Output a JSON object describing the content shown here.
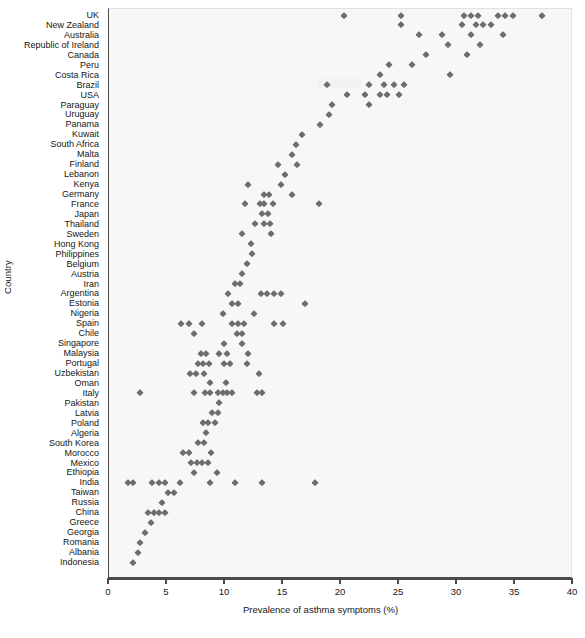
{
  "chart_data": {
    "type": "scatter",
    "title": "",
    "xlabel": "Prevalence of asthma symptoms (%)",
    "ylabel": "Country",
    "xlim": [
      0,
      40
    ],
    "xticks": [
      0,
      5,
      10,
      15,
      20,
      25,
      30,
      35,
      40
    ],
    "grid": false,
    "legend": "none",
    "marker": "diamond",
    "marker_color": "#6d6d6d",
    "panel_color": "#f7f7f7",
    "categories": [
      "UK",
      "New Zealand",
      "Australia",
      "Republic of Ireland",
      "Canada",
      "Peru",
      "Costa Rica",
      "Brazil",
      "USA",
      "Paraguay",
      "Uruguay",
      "Panama",
      "Kuwait",
      "South Africa",
      "Malta",
      "Finland",
      "Lebanon",
      "Kenya",
      "Germany",
      "France",
      "Japan",
      "Thailand",
      "Sweden",
      "Hong Kong",
      "Philippines",
      "Belgium",
      "Austria",
      "Iran",
      "Argentina",
      "Estonia",
      "Nigeria",
      "Spain",
      "Chile",
      "Singapore",
      "Malaysia",
      "Portugal",
      "Uzbekistan",
      "Oman",
      "Italy",
      "Pakistan",
      "Latvia",
      "Poland",
      "Algeria",
      "South Korea",
      "Morocco",
      "Mexico",
      "Ethiopia",
      "India",
      "Taiwan",
      "Russia",
      "China",
      "Greece",
      "Georgia",
      "Romania",
      "Albania",
      "Indonesia"
    ],
    "points": [
      {
        "category": "UK",
        "values": [
          20.3,
          25.2,
          30.6,
          31.2,
          31.8,
          33.5,
          34.1,
          34.8,
          37.3
        ]
      },
      {
        "category": "New Zealand",
        "values": [
          25.2,
          30.4,
          31.6,
          32.2,
          32.9
        ]
      },
      {
        "category": "Australia",
        "values": [
          26.7,
          28.7,
          31.2,
          34.0
        ]
      },
      {
        "category": "Republic of Ireland",
        "values": [
          29.2,
          32.0
        ]
      },
      {
        "category": "Canada",
        "values": [
          27.3,
          30.9
        ]
      },
      {
        "category": "Peru",
        "values": [
          24.1,
          26.1
        ]
      },
      {
        "category": "Costa Rica",
        "values": [
          23.4,
          29.4
        ]
      },
      {
        "category": "Brazil",
        "values": [
          18.8,
          22.4,
          23.7,
          24.6,
          25.4
        ]
      },
      {
        "category": "USA",
        "values": [
          20.5,
          22.1,
          23.4,
          24.0,
          25.0
        ]
      },
      {
        "category": "Paraguay",
        "values": [
          19.2,
          22.4
        ]
      },
      {
        "category": "Uruguay",
        "values": [
          19.0
        ]
      },
      {
        "category": "Panama",
        "values": [
          18.2
        ]
      },
      {
        "category": "Kuwait",
        "values": [
          16.6
        ]
      },
      {
        "category": "South Africa",
        "values": [
          16.1
        ]
      },
      {
        "category": "Malta",
        "values": [
          15.8
        ]
      },
      {
        "category": "Finland",
        "values": [
          14.6,
          16.2
        ]
      },
      {
        "category": "Lebanon",
        "values": [
          15.2
        ]
      },
      {
        "category": "Kenya",
        "values": [
          12.0,
          14.8
        ]
      },
      {
        "category": "Germany",
        "values": [
          13.4,
          13.8,
          15.8
        ]
      },
      {
        "category": "France",
        "values": [
          11.7,
          13.0,
          13.4,
          14.1,
          18.1
        ]
      },
      {
        "category": "Japan",
        "values": [
          13.2,
          13.7
        ]
      },
      {
        "category": "Thailand",
        "values": [
          12.6,
          13.4,
          13.9
        ]
      },
      {
        "category": "Sweden",
        "values": [
          11.5,
          14.0
        ]
      },
      {
        "category": "Hong Kong",
        "values": [
          12.2
        ]
      },
      {
        "category": "Philippines",
        "values": [
          12.3
        ]
      },
      {
        "category": "Belgium",
        "values": [
          11.9
        ]
      },
      {
        "category": "Austria",
        "values": [
          11.5
        ]
      },
      {
        "category": "Iran",
        "values": [
          10.9,
          11.3
        ]
      },
      {
        "category": "Argentina",
        "values": [
          10.3,
          13.1,
          13.6,
          14.2,
          14.8
        ]
      },
      {
        "category": "Estonia",
        "values": [
          10.6,
          11.1,
          16.9
        ]
      },
      {
        "category": "Nigeria",
        "values": [
          9.8,
          12.5
        ]
      },
      {
        "category": "Spain",
        "values": [
          6.2,
          6.9,
          8.0,
          10.6,
          11.1,
          11.6,
          14.2,
          15.0
        ]
      },
      {
        "category": "Chile",
        "values": [
          7.3,
          11.0,
          11.5
        ]
      },
      {
        "category": "Singapore",
        "values": [
          9.9,
          11.5
        ]
      },
      {
        "category": "Malaysia",
        "values": [
          7.9,
          8.4,
          9.5,
          10.2,
          12.0
        ]
      },
      {
        "category": "Portugal",
        "values": [
          7.7,
          8.1,
          8.6,
          9.9,
          10.4,
          11.9
        ]
      },
      {
        "category": "Uzbekistan",
        "values": [
          7.0,
          7.5,
          8.2,
          12.9
        ]
      },
      {
        "category": "Oman",
        "values": [
          8.7,
          10.1
        ]
      },
      {
        "category": "Italy",
        "values": [
          2.7,
          7.3,
          8.3,
          8.7,
          9.4,
          9.8,
          10.2,
          10.6,
          12.8,
          13.2
        ]
      },
      {
        "category": "Pakistan",
        "values": [
          9.5
        ]
      },
      {
        "category": "Latvia",
        "values": [
          8.9,
          9.4
        ]
      },
      {
        "category": "Poland",
        "values": [
          8.1,
          8.5,
          9.1
        ]
      },
      {
        "category": "Algeria",
        "values": [
          8.4
        ]
      },
      {
        "category": "South Korea",
        "values": [
          7.7,
          8.2
        ]
      },
      {
        "category": "Morocco",
        "values": [
          6.4,
          6.9,
          8.8
        ]
      },
      {
        "category": "Mexico",
        "values": [
          7.1,
          7.6,
          8.0,
          8.5
        ]
      },
      {
        "category": "Ethiopia",
        "values": [
          7.3,
          9.3
        ]
      },
      {
        "category": "India",
        "values": [
          1.6,
          2.1,
          3.7,
          4.3,
          4.8,
          6.1,
          8.7,
          10.9,
          13.2,
          17.8
        ]
      },
      {
        "category": "Taiwan",
        "values": [
          5.1,
          5.6
        ]
      },
      {
        "category": "Russia",
        "values": [
          4.6
        ]
      },
      {
        "category": "China",
        "values": [
          3.4,
          3.9,
          4.3,
          4.8
        ]
      },
      {
        "category": "Greece",
        "values": [
          3.6
        ]
      },
      {
        "category": "Georgia",
        "values": [
          3.1
        ]
      },
      {
        "category": "Romania",
        "values": [
          2.7
        ]
      },
      {
        "category": "Albania",
        "values": [
          2.5
        ]
      },
      {
        "category": "Indonesia",
        "values": [
          2.1
        ]
      }
    ]
  },
  "axes": {
    "x_title": "Prevalence of asthma symptoms (%)",
    "y_title": "Country",
    "x_tick_labels": [
      "0",
      "5",
      "10",
      "15",
      "20",
      "25",
      "30",
      "35",
      "40"
    ]
  }
}
